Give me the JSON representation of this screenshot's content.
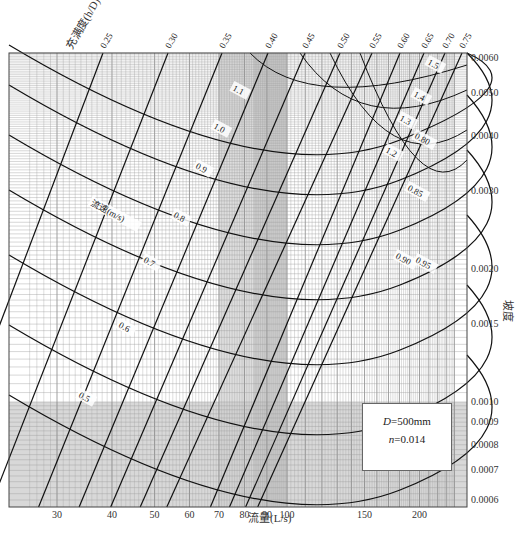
{
  "chart_data": {
    "type": "line",
    "xlabel": "流量(L/s)",
    "ylabel": "坡度",
    "x_scale": "log",
    "y_scale": "log",
    "xlim": [
      26,
      240
    ],
    "ylim": [
      0.0006,
      0.0062
    ],
    "x_ticks": [
      30,
      40,
      50,
      60,
      70,
      80,
      90,
      100,
      150,
      200
    ],
    "y_ticks": [
      0.006,
      0.005,
      0.004,
      0.003,
      0.002,
      0.0015,
      0.001,
      0.0009,
      0.0008,
      0.0007,
      0.0006
    ],
    "y_tick_labels": [
      "0.0060",
      "0.0050",
      "0.0040",
      "0.0030",
      "0.0020",
      "0.0015",
      "0.0010",
      "0.0009",
      "0.0008",
      "0.0007",
      "0.0006"
    ],
    "fill_ratio_title": "充满度(h/D)",
    "fill_ratio_curves": [
      "0.25",
      "0.30",
      "0.35",
      "0.40",
      "0.45",
      "0.50",
      "0.55",
      "0.60",
      "0.65",
      "0.70",
      "0.75"
    ],
    "velocity_title": "流速(m/s)",
    "velocity_curves": [
      "0.5",
      "0.6",
      "0.7",
      "0.8",
      "0.85",
      "0.9",
      "0.90",
      "0.95",
      "1.0",
      "1.1",
      "1.2",
      "1.3",
      "1.4",
      "1.5",
      "0.80"
    ],
    "velocity_labels_visible": [
      "0.5",
      "0.6",
      "0.7",
      "0.8",
      "0.9",
      "1.0",
      "1.1",
      "1.2",
      "1.3",
      "1.4",
      "1.5",
      "0.80",
      "0.85",
      "0.90",
      "0.95"
    ],
    "legend": {
      "diameter": "D=500mm",
      "roughness": "n=0.014"
    },
    "grid": true
  },
  "labels": {
    "x_axis_title": "流量(L/s)",
    "y_axis_title": "坡度",
    "fill_title": "充满度(h/D)",
    "velocity_title": "流速(m/s)",
    "legend_d_var": "D",
    "legend_d_val": "=500mm",
    "legend_n_var": "n",
    "legend_n_val": "=0.014"
  }
}
